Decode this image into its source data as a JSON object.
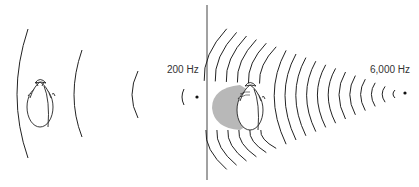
{
  "figure": {
    "colors": {
      "line": "#222222",
      "shadow": "#b8b8b8",
      "divider": "#444444",
      "background": "#ffffff"
    },
    "panels": [
      {
        "id": "low",
        "frequency_label": "200 Hz",
        "source": {
          "x": 197,
          "y": 97
        },
        "head": {
          "cx": 40,
          "cy": 101
        },
        "acoustic_shadow": false,
        "arcs": [
          {
            "x": 183,
            "half": 8
          },
          {
            "x": 133,
            "half": 24
          },
          {
            "x": 75,
            "half": 44
          },
          {
            "x": 17,
            "half": 66
          }
        ]
      },
      {
        "id": "high",
        "frequency_label": "6,000 Hz",
        "source": {
          "x": 405,
          "y": 93
        },
        "head": {
          "cx": 250,
          "cy": 104
        },
        "acoustic_shadow": true,
        "arc_count": 18
      }
    ],
    "divider": {
      "x": 207,
      "y1": 5,
      "y2": 180
    }
  }
}
